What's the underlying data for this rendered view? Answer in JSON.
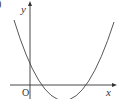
{
  "diagram": {
    "type": "function-graph",
    "labels": {
      "y_axis": "y",
      "x_axis": "x",
      "origin": "O",
      "corner_fragment": ")"
    },
    "colors": {
      "axis": "#333333",
      "curve": "#444444",
      "background": "#ffffff"
    },
    "geometry": {
      "origin_px": [
        30,
        85
      ],
      "y_intercept_px": [
        30,
        62
      ],
      "x_intercepts_px": [
        [
          40,
          85
        ],
        [
          85,
          85
        ]
      ],
      "vertex_px": [
        63,
        100
      ],
      "curve_start_px": [
        14,
        20
      ],
      "curve_end_px": [
        114,
        22
      ]
    }
  }
}
